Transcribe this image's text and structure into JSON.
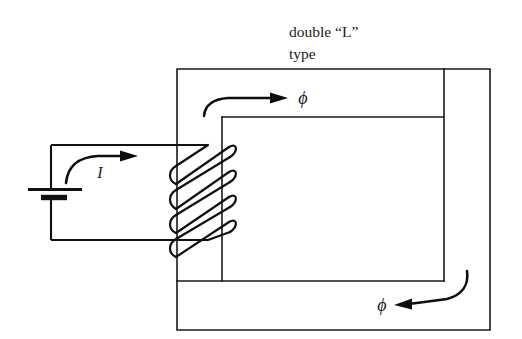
{
  "figure": {
    "title_line1": "double “L”",
    "title_line2": "type",
    "ink_color": "#1a1a1a",
    "background_color": "#ffffff"
  },
  "labels": {
    "current": "I",
    "flux_top": "ϕ",
    "flux_bottom": "ϕ"
  },
  "components": {
    "battery_name": "dc-battery",
    "coil_name": "coil-winding",
    "coil_turns": 4,
    "core_name": "double-l-core"
  },
  "annotations": {
    "flux_top_direction": "right",
    "flux_bottom_direction": "left",
    "current_direction": "right"
  }
}
